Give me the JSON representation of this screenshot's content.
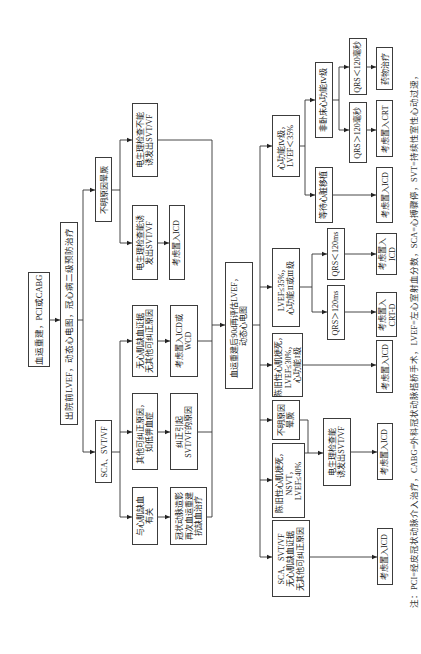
{
  "figure": {
    "type": "flowchart",
    "orientation": "rotated 90 degrees counter-clockwise",
    "nodes": {
      "root": "血运重建，PCI或CABG",
      "discharge": "出院前LVEF，动态心电图，冠心病二级预防治疗",
      "syncope1": "不明原因晕厥",
      "sca1": "SCA、SVT/VF",
      "ep_neg": "电生理检查不能\n诱发出SVT/VF",
      "ep_pos1": "电生理检查能诱\n发出SVT/VF",
      "icd1": "考虑置入ICD",
      "no_ischemia": "无心肌缺血证据\n无其他可纠正原因",
      "icd_wcd": "考虑置入ICD或\nWCD",
      "correctable": "其他可纠正原因，\n如低钾血症",
      "correct": "纠正引起\nSVT/VF的原因",
      "ischemia": "与心肌缺血\n有关",
      "cag": "冠状动脉造影\n再次血运重建\n抗缺血治疗",
      "reassess": "血运重建后90d再评估LVEF，\n动态心电图",
      "nyha4": "心功能Ⅳ级，\nLVEF＜35%",
      "ambulatory": "非卧床心功能Ⅳ级",
      "transplant": "等待心脏移植",
      "qrs_lt1": "QRS＜120毫秒",
      "qrs_gt1": "QRS＞120毫秒",
      "drug": "药物治疗",
      "crt": "考虑置入CRT",
      "icd_transplant": "考虑置入ICD",
      "lvef35": "LVEF≤35%，\n心功能Ⅱ或Ⅲ级",
      "qrs_lt2": "QRS＜120ms",
      "qrs_gt2": "QRS＞120ms",
      "icd2": "考虑置入\nICD",
      "crtd": "考虑置入\nCRT-D",
      "old_mi30": "陈旧性心肌梗死，\nLVEF≤30%，\n心功能Ⅰ级",
      "icd3": "考虑置入ICD",
      "syncope2": "不明原因\n晕厥",
      "old_mi_nsvt": "陈旧性心肌梗死，\nNSVT，\nLVEF≤40%",
      "ep_pos2": "电生理检查能\n诱发出SVT/VF",
      "icd4": "考虑置入ICD",
      "sca2": "SCA、SVT/VF\n无心肌缺血证据\n无其他可纠正原因",
      "icd5": "考虑置入ICD"
    },
    "edges": [
      [
        "root",
        "discharge"
      ],
      [
        "discharge",
        "syncope1"
      ],
      [
        "discharge",
        "sca1"
      ],
      [
        "syncope1",
        "ep_neg"
      ],
      [
        "syncope1",
        "ep_pos1"
      ],
      [
        "ep_pos1",
        "icd1"
      ],
      [
        "sca1",
        "no_ischemia"
      ],
      [
        "sca1",
        "correctable"
      ],
      [
        "sca1",
        "ischemia"
      ],
      [
        "no_ischemia",
        "icd_wcd"
      ],
      [
        "correctable",
        "correct"
      ],
      [
        "ischemia",
        "cag"
      ],
      [
        "ep_neg",
        "reassess"
      ],
      [
        "icd_wcd",
        "reassess"
      ],
      [
        "correct",
        "reassess"
      ],
      [
        "cag",
        "reassess"
      ],
      [
        "reassess",
        "nyha4"
      ],
      [
        "reassess",
        "lvef35"
      ],
      [
        "reassess",
        "old_mi30"
      ],
      [
        "reassess",
        "syncope2"
      ],
      [
        "reassess",
        "old_mi_nsvt"
      ],
      [
        "reassess",
        "sca2"
      ],
      [
        "nyha4",
        "ambulatory"
      ],
      [
        "nyha4",
        "transplant"
      ],
      [
        "ambulatory",
        "qrs_lt1"
      ],
      [
        "ambulatory",
        "qrs_gt1"
      ],
      [
        "qrs_lt1",
        "drug"
      ],
      [
        "qrs_gt1",
        "crt"
      ],
      [
        "transplant",
        "icd_transplant"
      ],
      [
        "lvef35",
        "qrs_lt2"
      ],
      [
        "lvef35",
        "qrs_gt2"
      ],
      [
        "qrs_lt2",
        "icd2"
      ],
      [
        "qrs_gt2",
        "crtd"
      ],
      [
        "old_mi30",
        "icd3"
      ],
      [
        "syncope2",
        "ep_pos2"
      ],
      [
        "old_mi_nsvt",
        "ep_pos2"
      ],
      [
        "ep_pos2",
        "icd4"
      ],
      [
        "sca2",
        "icd5"
      ]
    ],
    "note": "注：PCI=经皮冠状动脉介入治疗，CABG=外科冠状动脉搭桥手术，LVEF=左心室射血分数，SCA=心搏骤停，SVT=持续性室性心动过速，"
  }
}
